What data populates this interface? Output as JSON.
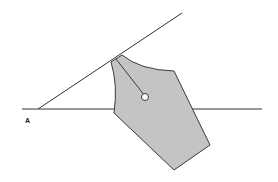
{
  "diagram": {
    "type": "pen-nib-angle",
    "labels": {
      "vertex": "A"
    },
    "colors": {
      "background": "#ffffff",
      "line": "#333333",
      "nib_fill": "#c4c4c4",
      "nib_stroke": "#3a3a3a",
      "hole_fill": "#ffffff"
    },
    "baseline": {
      "x1": 22,
      "y1": 109,
      "x2": 262,
      "y2": 109
    },
    "angle_line": {
      "x1": 38,
      "y1": 109,
      "x2": 182,
      "y2": 13
    },
    "nib": {
      "outline": "M111,62 L122,55 Q140,70 174,71 L210,145 L174,170 L114,113 Q118,85 111,62 Z",
      "slit": {
        "x1": 116,
        "y1": 59,
        "x2": 145,
        "y2": 96
      },
      "hole": {
        "cx": 145,
        "cy": 97,
        "r": 3.5
      }
    }
  }
}
